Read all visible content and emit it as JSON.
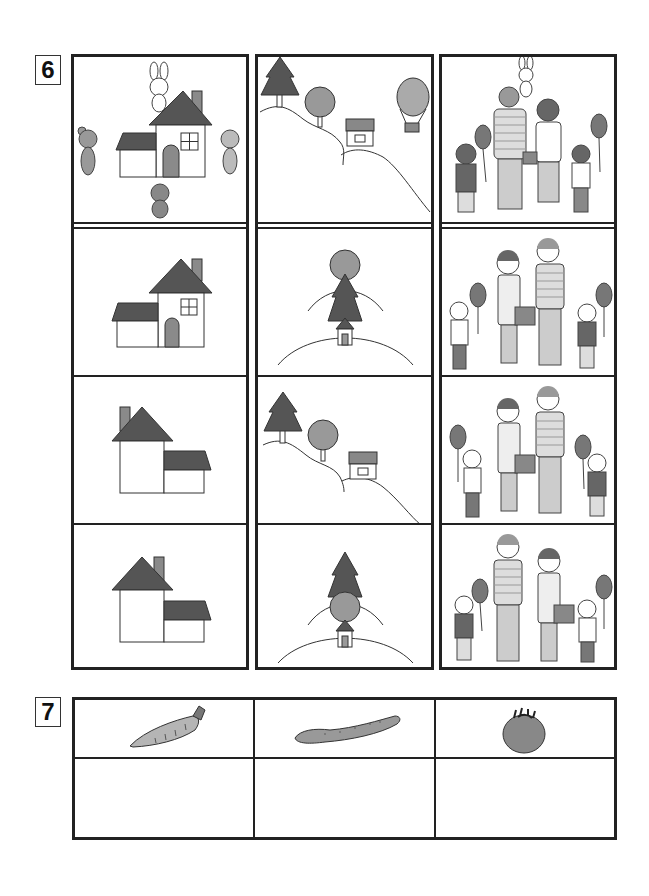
{
  "questions": [
    {
      "number": "6",
      "columns": [
        {
          "name": "houses",
          "cells": [
            {
              "description": "reference: house with rabbit above, bear left, cat right, monkey below"
            },
            {
              "description": "house, tall part right, chimney right, door in tall part"
            },
            {
              "description": "house, tall part left, chimney left, low part right"
            },
            {
              "description": "house, tall part left, chimney right of peak, low part right"
            }
          ]
        },
        {
          "name": "hillside",
          "cells": [
            {
              "description": "reference: pine tree, round tree, house on hill slope, hot air balloon"
            },
            {
              "description": "round tree behind pine tree behind house on hill (viewed from front)"
            },
            {
              "description": "pine tree, round tree, house on hill slope (no balloon)"
            },
            {
              "description": "pine tree behind round tree behind house on hill"
            }
          ]
        },
        {
          "name": "family",
          "cells": [
            {
              "description": "reference: family seen from behind with rabbit mascot, balloons"
            },
            {
              "description": "girl, mother, father, boy seen from front"
            },
            {
              "description": "girl, mother, father, boy seen from front (variant)"
            },
            {
              "description": "boy, father, mother, girl seen from front"
            }
          ]
        }
      ]
    },
    {
      "number": "7",
      "items": [
        {
          "name": "carrot",
          "icon": "carrot-icon"
        },
        {
          "name": "cucumber",
          "icon": "cucumber-icon"
        },
        {
          "name": "tomato",
          "icon": "tomato-icon"
        }
      ],
      "answer_cells": [
        "",
        "",
        ""
      ]
    }
  ],
  "colors": {
    "line": "#222222",
    "dark_fill": "#555555",
    "mid_fill": "#8a8a8a",
    "light_fill": "#b5b5b5"
  }
}
